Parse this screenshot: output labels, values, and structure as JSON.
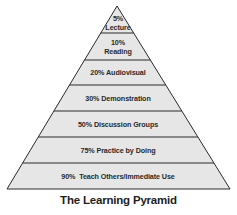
{
  "diagram": {
    "type": "pyramid",
    "title": "The Learning Pyramid",
    "fill_color": "#e6e6e6",
    "stroke_color": "#2a2a2a",
    "levels": [
      {
        "percent": "5%",
        "label": "Lecture",
        "line1": "5%",
        "line2": "Lecture"
      },
      {
        "percent": "10%",
        "label": "Reading",
        "line1": "10%",
        "line2": "Reading"
      },
      {
        "percent": "20%",
        "label": "Audiovisual",
        "line1": "20% Audiovisual"
      },
      {
        "percent": "30%",
        "label": "Demonstration",
        "line1": "30% Demonstration"
      },
      {
        "percent": "50%",
        "label": "Discussion Groups",
        "line1": "50% Discussion Groups"
      },
      {
        "percent": "75%",
        "label": "Practice by Doing",
        "line1": "75% Practice by Doing"
      },
      {
        "percent": "90%",
        "label": "Teach Others/Immediate Use",
        "line1": "90%  Teach Others/Immediate Use"
      }
    ]
  }
}
